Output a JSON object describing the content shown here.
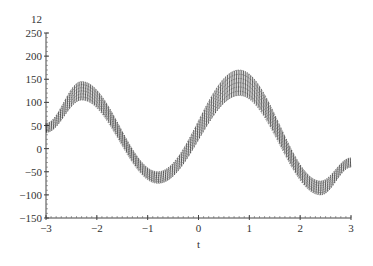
{
  "chart_data": {
    "type": "line",
    "title": "",
    "corner_label": "12",
    "xlabel": "t",
    "ylabel": "",
    "xlim": [
      -3,
      3
    ],
    "ylim": [
      -150,
      250
    ],
    "xticks": [
      "-3",
      "-2",
      "-1",
      "0",
      "1",
      "2",
      "3"
    ],
    "yticks": [
      "250",
      "200",
      "150",
      "100",
      "50",
      "0",
      "-50",
      "-100",
      "-150"
    ],
    "grid": false,
    "legend": null,
    "series": [
      {
        "name": "upper envelope",
        "x": [
          -3,
          -2.3,
          -0.8,
          0.8,
          2.4,
          3
        ],
        "values": [
          55,
          145,
          -50,
          170,
          -70,
          -20
        ]
      },
      {
        "name": "center",
        "x": [
          -3,
          -2.3,
          -0.8,
          0.8,
          2.4,
          3
        ],
        "values": [
          45,
          125,
          -60,
          140,
          -85,
          -30
        ]
      },
      {
        "name": "lower envelope",
        "x": [
          -3,
          -2.3,
          -0.8,
          0.8,
          2.4,
          3
        ],
        "values": [
          35,
          105,
          -75,
          115,
          -100,
          -40
        ]
      }
    ]
  },
  "axes": {
    "x_label": "t",
    "corner_label": "12",
    "x_ticks": [
      "−3",
      "−2",
      "−1",
      "0",
      "1",
      "2",
      "3"
    ],
    "y_ticks": [
      "250",
      "200",
      "150",
      "100",
      "50",
      "0",
      "−50",
      "−100",
      "−150"
    ]
  }
}
